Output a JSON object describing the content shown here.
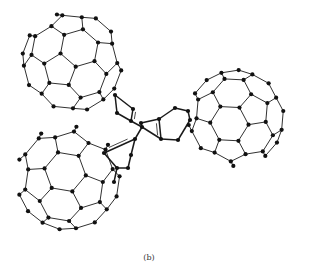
{
  "figure": {
    "caption": "(b)",
    "colors": {
      "bond": "#1a1a1a",
      "atom": "#111111",
      "background": "#ffffff"
    },
    "cages": [
      {
        "name": "cage-top-left",
        "cx": 72,
        "cy": 62,
        "r": 50,
        "rotX": 0.35,
        "rotY": -0.25,
        "rotZ": 0.1
      },
      {
        "name": "cage-right",
        "cx": 236,
        "cy": 118,
        "r": 48,
        "rotX": -0.2,
        "rotY": 0.3,
        "rotZ": 0.5
      },
      {
        "name": "cage-bottom-left",
        "cx": 68,
        "cy": 178,
        "r": 52,
        "rotX": 0.15,
        "rotY": 0.35,
        "rotZ": -0.3
      }
    ],
    "linker": {
      "atoms": [
        [
          115,
          95
        ],
        [
          117,
          113
        ],
        [
          131,
          121
        ],
        [
          142,
          127
        ],
        [
          133,
          109
        ],
        [
          141,
          123
        ],
        [
          159,
          119
        ],
        [
          161,
          139
        ],
        [
          178,
          140
        ],
        [
          190,
          120
        ],
        [
          175,
          108
        ],
        [
          188,
          111
        ],
        [
          135,
          139
        ],
        [
          131,
          155
        ],
        [
          117,
          168
        ],
        [
          114,
          182
        ],
        [
          104,
          153
        ],
        [
          128,
          168
        ]
      ],
      "bonds": [
        [
          0,
          1
        ],
        [
          1,
          2
        ],
        [
          2,
          3
        ],
        [
          3,
          5
        ],
        [
          2,
          4
        ],
        [
          4,
          0
        ],
        [
          5,
          6
        ],
        [
          6,
          10
        ],
        [
          10,
          11
        ],
        [
          11,
          9
        ],
        [
          9,
          8
        ],
        [
          8,
          7
        ],
        [
          7,
          3
        ],
        [
          6,
          7
        ],
        [
          3,
          12
        ],
        [
          12,
          13
        ],
        [
          13,
          17
        ],
        [
          17,
          14
        ],
        [
          14,
          15
        ],
        [
          12,
          16
        ],
        [
          16,
          14
        ]
      ],
      "double_bonds": [
        [
          2,
          4
        ],
        [
          6,
          7
        ],
        [
          12,
          16
        ]
      ]
    }
  }
}
